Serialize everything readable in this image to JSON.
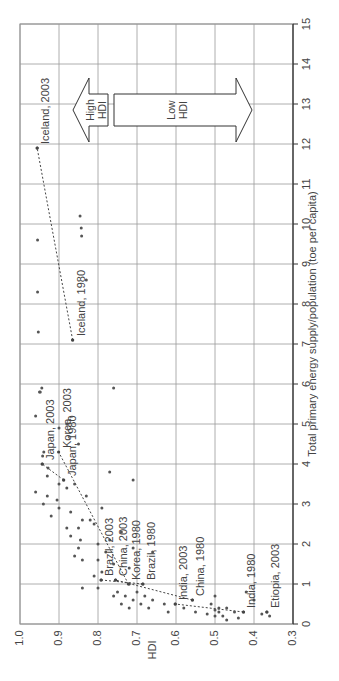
{
  "chart_data": {
    "type": "scatter",
    "orientation": "rotated-90-ccw",
    "title": "",
    "xlabel": "Total primary energy supply/population (toe per capita)",
    "ylabel": "HDI",
    "xlim": [
      0,
      15
    ],
    "ylim": [
      0.3,
      1.0
    ],
    "xticks": [
      0,
      1,
      2,
      3,
      4,
      5,
      6,
      7,
      8,
      9,
      10,
      11,
      12,
      13,
      14,
      15
    ],
    "yticks": [
      "0.3",
      "0.4",
      "0.5",
      "0.6",
      "0.7",
      "0.8",
      "0.9",
      "1.0"
    ],
    "grid": true,
    "annotations": [
      {
        "label": "High HDI",
        "line1": "High",
        "line2": "HDI",
        "type": "arrow",
        "direction": "toward-high-hdi"
      },
      {
        "label": "Low HDI",
        "line1": "Low",
        "line2": "HDI",
        "type": "arrow",
        "direction": "toward-low-hdi"
      }
    ],
    "labeled_points": [
      {
        "label": "Iceland, 2003",
        "x": 11.9,
        "y": 0.956
      },
      {
        "label": "Iceland, 1980",
        "x": 7.1,
        "y": 0.865
      },
      {
        "label": "Japan, 2003",
        "x": 4.0,
        "y": 0.943
      },
      {
        "label": "Japan, 1980",
        "x": 3.6,
        "y": 0.888
      },
      {
        "label": "Korea, 2003",
        "x": 4.3,
        "y": 0.901
      },
      {
        "label": "Korea, 1980",
        "x": 1.0,
        "y": 0.722
      },
      {
        "label": "Brazil, 2003",
        "x": 1.1,
        "y": 0.792
      },
      {
        "label": "Brazil, 1980",
        "x": 1.0,
        "y": 0.685
      },
      {
        "label": "China, 2003",
        "x": 1.1,
        "y": 0.755
      },
      {
        "label": "China, 1980",
        "x": 0.6,
        "y": 0.558
      },
      {
        "label": "India, 2003",
        "x": 0.5,
        "y": 0.602
      },
      {
        "label": "India, 1980",
        "x": 0.3,
        "y": 0.427
      },
      {
        "label": "Etiopia, 2003",
        "x": 0.3,
        "y": 0.367
      }
    ],
    "trajectories": [
      {
        "name": "Iceland",
        "points": [
          [
            7.1,
            0.865
          ],
          [
            11.9,
            0.956
          ]
        ]
      },
      {
        "name": "Japan",
        "points": [
          [
            3.6,
            0.888
          ],
          [
            4.0,
            0.943
          ]
        ]
      },
      {
        "name": "Korea",
        "points": [
          [
            1.0,
            0.722
          ],
          [
            4.3,
            0.901
          ]
        ]
      },
      {
        "name": "Brazil",
        "points": [
          [
            1.0,
            0.685
          ],
          [
            1.1,
            0.792
          ]
        ]
      },
      {
        "name": "China",
        "points": [
          [
            0.6,
            0.558
          ],
          [
            1.1,
            0.755
          ]
        ]
      },
      {
        "name": "India",
        "points": [
          [
            0.3,
            0.427
          ],
          [
            0.5,
            0.602
          ]
        ]
      }
    ],
    "series": [
      {
        "name": "countries",
        "points": [
          [
            11.9,
            0.956
          ],
          [
            9.6,
            0.955
          ],
          [
            10.2,
            0.846
          ],
          [
            9.9,
            0.843
          ],
          [
            9.7,
            0.842
          ],
          [
            8.6,
            0.83
          ],
          [
            8.3,
            0.955
          ],
          [
            7.3,
            0.953
          ],
          [
            7.1,
            0.865
          ],
          [
            5.9,
            0.944
          ],
          [
            5.8,
            0.948
          ],
          [
            5.8,
            0.95
          ],
          [
            5.2,
            0.96
          ],
          [
            5.0,
            0.88
          ],
          [
            4.9,
            0.9
          ],
          [
            4.5,
            0.85
          ],
          [
            5.9,
            0.76
          ],
          [
            4.3,
            0.939
          ],
          [
            4.2,
            0.942
          ],
          [
            4.0,
            0.943
          ],
          [
            3.9,
            0.928
          ],
          [
            3.7,
            0.93
          ],
          [
            3.6,
            0.888
          ],
          [
            3.5,
            0.9
          ],
          [
            3.5,
            0.86
          ],
          [
            3.4,
            0.88
          ],
          [
            3.3,
            0.96
          ],
          [
            3.2,
            0.93
          ],
          [
            3.1,
            0.905
          ],
          [
            3.0,
            0.94
          ],
          [
            2.9,
            0.9
          ],
          [
            2.8,
            0.87
          ],
          [
            2.7,
            0.92
          ],
          [
            2.6,
            0.84
          ],
          [
            2.5,
            0.81
          ],
          [
            2.4,
            0.85
          ],
          [
            2.4,
            0.88
          ],
          [
            2.2,
            0.87
          ],
          [
            2.1,
            0.845
          ],
          [
            2.0,
            0.8
          ],
          [
            1.9,
            0.85
          ],
          [
            1.8,
            0.78
          ],
          [
            1.7,
            0.86
          ],
          [
            1.6,
            0.84
          ],
          [
            1.5,
            0.76
          ],
          [
            1.4,
            0.72
          ],
          [
            3.8,
            0.77
          ],
          [
            3.6,
            0.71
          ],
          [
            3.2,
            0.83
          ],
          [
            2.9,
            0.79
          ],
          [
            2.6,
            0.82
          ],
          [
            2.3,
            0.74
          ],
          [
            2.1,
            0.77
          ],
          [
            1.9,
            0.71
          ],
          [
            1.8,
            0.66
          ],
          [
            1.6,
            0.8
          ],
          [
            1.3,
            0.79
          ],
          [
            1.2,
            0.81
          ],
          [
            1.1,
            0.792
          ],
          [
            1.1,
            0.755
          ],
          [
            1.0,
            0.72
          ],
          [
            1.0,
            0.685
          ],
          [
            0.9,
            0.84
          ],
          [
            0.9,
            0.8
          ],
          [
            0.8,
            0.75
          ],
          [
            0.8,
            0.7
          ],
          [
            0.7,
            0.76
          ],
          [
            0.7,
            0.73
          ],
          [
            0.7,
            0.68
          ],
          [
            0.6,
            0.71
          ],
          [
            0.6,
            0.66
          ],
          [
            0.5,
            0.74
          ],
          [
            0.5,
            0.69
          ],
          [
            0.5,
            0.63
          ],
          [
            0.4,
            0.72
          ],
          [
            0.4,
            0.67
          ],
          [
            0.3,
            0.62
          ],
          [
            0.6,
            0.558
          ],
          [
            0.5,
            0.602
          ],
          [
            0.5,
            0.51
          ],
          [
            0.4,
            0.49
          ],
          [
            0.4,
            0.47
          ],
          [
            0.35,
            0.5
          ],
          [
            0.3,
            0.45
          ],
          [
            0.3,
            0.427
          ],
          [
            0.3,
            0.49
          ],
          [
            0.25,
            0.52
          ],
          [
            0.2,
            0.48
          ],
          [
            0.2,
            0.5
          ],
          [
            0.15,
            0.44
          ],
          [
            0.1,
            0.47
          ],
          [
            0.7,
            0.5
          ],
          [
            0.8,
            0.42
          ],
          [
            0.6,
            0.4
          ],
          [
            0.3,
            0.367
          ],
          [
            0.25,
            0.38
          ],
          [
            0.2,
            0.36
          ],
          [
            0.4,
            0.58
          ],
          [
            0.3,
            0.55
          ]
        ]
      }
    ]
  }
}
